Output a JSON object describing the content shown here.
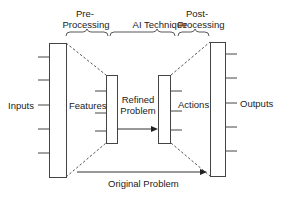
{
  "diagram": {
    "stages": {
      "pre_processing": {
        "line1": "Pre-",
        "line2": "Processing"
      },
      "ai_technique": {
        "label": "AI Technique"
      },
      "post_processing": {
        "line1": "Post-",
        "line2": "Processing"
      }
    },
    "labels": {
      "inputs": "Inputs",
      "features": "Features",
      "refined_problem_line1": "Refined",
      "refined_problem_line2": "Problem",
      "actions": "Actions",
      "outputs": "Outputs",
      "original_problem": "Original Problem"
    },
    "colors": {
      "stroke": "#444444",
      "text": "#222222",
      "background": "#ffffff"
    }
  }
}
